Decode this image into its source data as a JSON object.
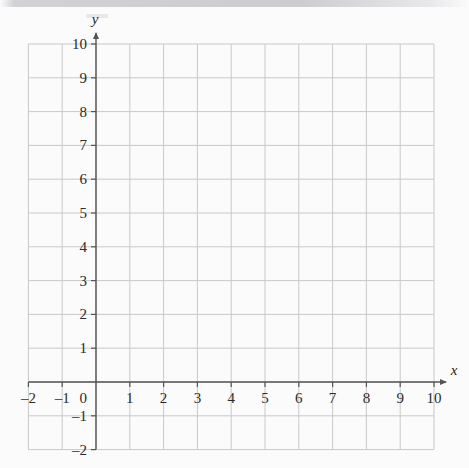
{
  "figure": {
    "kind": "cartesian-coordinate-grid",
    "background_color": "#fbfbfc",
    "gridline_color": "#c9c9c9",
    "axis_color": "#555555",
    "label_color": "#2a2a2a"
  },
  "axes": {
    "x": {
      "name": "x",
      "min": -2,
      "max": 10,
      "step": 1,
      "tick_labels": [
        "-2",
        "-1",
        "0",
        "1",
        "2",
        "3",
        "4",
        "5",
        "6",
        "7",
        "8",
        "9",
        "10"
      ],
      "has_arrow": true,
      "arrow_side": "right"
    },
    "y": {
      "name": "y",
      "min": -2,
      "max": 10,
      "step": 1,
      "tick_labels": [
        "-2",
        "-1",
        "0",
        "1",
        "2",
        "3",
        "4",
        "5",
        "6",
        "7",
        "8",
        "9",
        "10"
      ],
      "has_arrow": true,
      "arrow_side": "top"
    }
  },
  "chart_data": {
    "type": "scatter",
    "title": "",
    "subtitle": "",
    "xlabel": "x",
    "ylabel": "y",
    "xlim": [
      -2,
      10
    ],
    "ylim": [
      -2,
      10
    ],
    "xticks": [
      -2,
      -1,
      0,
      1,
      2,
      3,
      4,
      5,
      6,
      7,
      8,
      9,
      10
    ],
    "yticks": [
      -2,
      -1,
      0,
      1,
      2,
      3,
      4,
      5,
      6,
      7,
      8,
      9,
      10
    ],
    "xtick_labels": [
      "-2",
      "-1",
      "0",
      "1",
      "2",
      "3",
      "4",
      "5",
      "6",
      "7",
      "8",
      "9",
      "10"
    ],
    "ytick_labels": [
      "-2",
      "-1",
      "0",
      "1",
      "2",
      "3",
      "4",
      "5",
      "6",
      "7",
      "8",
      "9",
      "10"
    ],
    "grid": true,
    "legend": null,
    "legend_position": "none",
    "annotations": [],
    "series": [],
    "x": [],
    "values": []
  }
}
